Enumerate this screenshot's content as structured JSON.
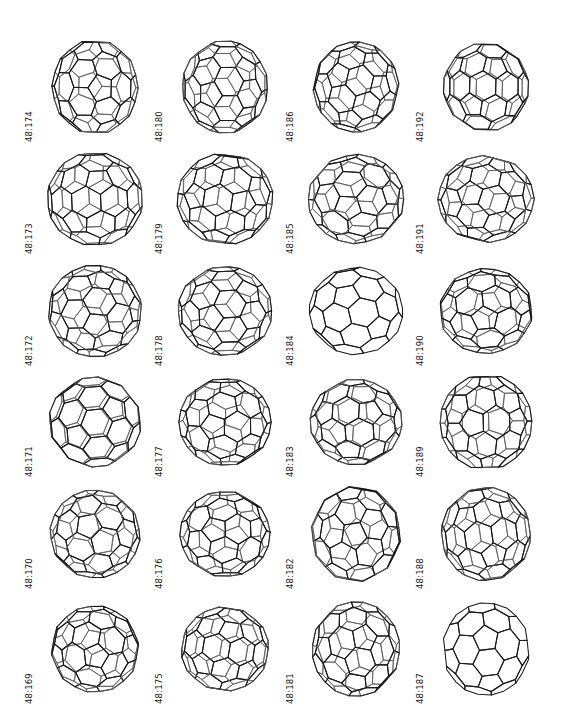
{
  "plate": {
    "title": "48:169 - 48:192",
    "background_color": "#ffffff",
    "ink_color": "#1a1a1a",
    "columns": 4,
    "rows": 6,
    "label_rotation_degrees": 90,
    "figure_style": "wireframe polyhedron line drawing"
  },
  "figures": [
    {
      "label": "48:169",
      "col": 0,
      "row": 5,
      "style": "wireframe",
      "view": "two-fold axis, flattened top and bottom bands",
      "icon": "fullerene-icon"
    },
    {
      "label": "48:170",
      "col": 0,
      "row": 4,
      "style": "wireframe",
      "view": "tilted, small central pentagon cluster",
      "icon": "fullerene-icon"
    },
    {
      "label": "48:171",
      "col": 0,
      "row": 3,
      "style": "wireframe",
      "view": "tilted, broad hexagon belt",
      "icon": "fullerene-icon"
    },
    {
      "label": "48:172",
      "col": 0,
      "row": 2,
      "style": "wireframe",
      "view": "near-spherical, off-axis",
      "icon": "fullerene-icon"
    },
    {
      "label": "48:173",
      "col": 0,
      "row": 1,
      "style": "wireframe",
      "view": "elongated, large front hexagon",
      "icon": "fullerene-icon"
    },
    {
      "label": "48:174",
      "col": 0,
      "row": 0,
      "style": "wireframe",
      "view": "tilted, wide front faces",
      "icon": "fullerene-icon"
    },
    {
      "label": "48:175",
      "col": 1,
      "row": 5,
      "style": "wireframe",
      "view": "tilted, dense rear edges",
      "icon": "fullerene-icon"
    },
    {
      "label": "48:176",
      "col": 1,
      "row": 4,
      "style": "wireframe",
      "view": "near-spherical, large front pentagons",
      "icon": "fullerene-icon"
    },
    {
      "label": "48:177",
      "col": 1,
      "row": 3,
      "style": "wireframe",
      "view": "tilted, banded equator",
      "icon": "fullerene-icon"
    },
    {
      "label": "48:178",
      "col": 1,
      "row": 2,
      "style": "wireframe",
      "view": "rounded, central hexagon",
      "icon": "fullerene-icon"
    },
    {
      "label": "48:179",
      "col": 1,
      "row": 1,
      "style": "wireframe",
      "view": "tilted, flat front hexagon",
      "icon": "fullerene-icon"
    },
    {
      "label": "48:180",
      "col": 1,
      "row": 0,
      "style": "wireframe",
      "view": "tilted, wide equatorial band",
      "icon": "fullerene-icon"
    },
    {
      "label": "48:181",
      "col": 2,
      "row": 5,
      "style": "wireframe",
      "view": "tilted, large upper hexagon",
      "icon": "fullerene-icon"
    },
    {
      "label": "48:182",
      "col": 2,
      "row": 4,
      "style": "wireframe",
      "view": "near-spherical, central cluster",
      "icon": "fullerene-icon"
    },
    {
      "label": "48:183",
      "col": 2,
      "row": 3,
      "style": "wireframe",
      "view": "tilted, large top hexagon",
      "icon": "fullerene-icon"
    },
    {
      "label": "48:184",
      "col": 2,
      "row": 2,
      "style": "hidden-line-removed",
      "view": "front faces only, large central hexagon",
      "icon": "fullerene-icon"
    },
    {
      "label": "48:185",
      "col": 2,
      "row": 1,
      "style": "wireframe",
      "view": "tilted, many visible rear edges",
      "icon": "fullerene-icon"
    },
    {
      "label": "48:186",
      "col": 2,
      "row": 0,
      "style": "wireframe",
      "view": "down a ten-fold-like axis, open central ring",
      "icon": "fullerene-icon"
    },
    {
      "label": "48:187",
      "col": 3,
      "row": 5,
      "style": "hidden-line-removed",
      "view": "front faces only, rounded triangular outline",
      "icon": "fullerene-icon"
    },
    {
      "label": "48:188",
      "col": 3,
      "row": 4,
      "style": "wireframe",
      "view": "triangular silhouette, central hexagon",
      "icon": "fullerene-icon"
    },
    {
      "label": "48:189",
      "col": 3,
      "row": 3,
      "style": "wireframe",
      "view": "down an axis, open central ring",
      "icon": "fullerene-icon"
    },
    {
      "label": "48:190",
      "col": 3,
      "row": 2,
      "style": "wireframe",
      "view": "tilted, rounded body",
      "icon": "fullerene-icon"
    },
    {
      "label": "48:191",
      "col": 3,
      "row": 1,
      "style": "wireframe",
      "view": "near-spherical, front pentagon ring",
      "icon": "fullerene-icon"
    },
    {
      "label": "48:192",
      "col": 3,
      "row": 0,
      "style": "wireframe",
      "view": "tilted, broad front hexagons",
      "icon": "fullerene-icon"
    }
  ]
}
